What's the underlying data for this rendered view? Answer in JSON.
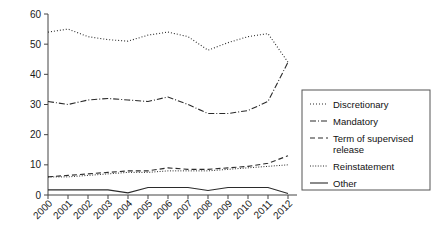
{
  "chart_data": {
    "type": "line",
    "title": "",
    "subtitle": "",
    "xlabel": "",
    "ylabel": "",
    "grid": false,
    "legend_position": "right",
    "x": [
      "2000",
      "2001",
      "2002",
      "2003",
      "2004",
      "2005",
      "2006",
      "2007",
      "2008",
      "2009",
      "2010",
      "2011",
      "2012"
    ],
    "categories": [
      "2000",
      "2001",
      "2002",
      "2003",
      "2004",
      "2005",
      "2006",
      "2007",
      "2008",
      "2009",
      "2010",
      "2011",
      "2012"
    ],
    "xlim": [
      2000,
      2012
    ],
    "ylim": [
      0,
      60
    ],
    "yticks": [
      0,
      10,
      20,
      30,
      40,
      50,
      60
    ],
    "ytick_labels": [
      "0",
      "10",
      "20",
      "30",
      "40",
      "50",
      "60"
    ],
    "series": [
      {
        "name": "Discretionary",
        "style": "dotted",
        "values": [
          54.0,
          55.0,
          52.5,
          51.5,
          51.0,
          53.0,
          54.0,
          52.5,
          48.0,
          50.5,
          52.5,
          53.5,
          44.0
        ]
      },
      {
        "name": "Mandatory",
        "style": "dash-dot",
        "values": [
          31.0,
          30.0,
          31.5,
          32.0,
          31.5,
          31.0,
          32.5,
          30.0,
          27.0,
          27.0,
          28.0,
          31.0,
          44.0
        ]
      },
      {
        "name": "Term of supervised release",
        "style": "dashed",
        "values": [
          6.0,
          6.5,
          7.0,
          7.5,
          8.0,
          8.0,
          9.0,
          8.5,
          8.5,
          9.0,
          9.5,
          10.5,
          13.0
        ]
      },
      {
        "name": "Reinstatement",
        "style": "fine-dotted",
        "values": [
          6.0,
          6.0,
          6.5,
          7.0,
          7.5,
          7.5,
          8.0,
          8.0,
          8.0,
          8.5,
          9.0,
          9.5,
          10.0
        ]
      },
      {
        "name": "Other",
        "style": "solid",
        "values": [
          1.7,
          1.7,
          1.7,
          1.7,
          0.7,
          2.5,
          2.5,
          2.5,
          1.5,
          2.5,
          2.5,
          2.5,
          0.5
        ]
      }
    ]
  },
  "legend": {
    "items": [
      {
        "label": "Discretionary",
        "style": "dotted"
      },
      {
        "label": "Mandatory",
        "style": "dash-dot"
      },
      {
        "label": "Term of supervised",
        "label2": "release",
        "style": "dashed"
      },
      {
        "label": "Reinstatement",
        "style": "fine-dotted"
      },
      {
        "label": "Other",
        "style": "solid"
      }
    ]
  },
  "colors": {
    "line": "#2b2b2b",
    "axis": "#444444",
    "text": "#111111",
    "legend_border": "#555555",
    "background": "#ffffff"
  }
}
